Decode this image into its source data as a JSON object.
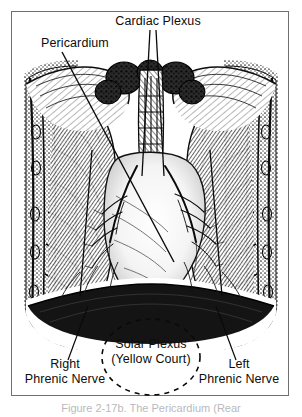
{
  "figure": {
    "caption": "Figure 2-17b. The Pericardium (Rear",
    "border_color": "#6f6f74",
    "ink_color": "#111111",
    "background": "#ffffff"
  },
  "labels": {
    "cardiac_plexus": "Cardiac Plexus",
    "pericardium": "Pericardium",
    "solar_plexus_line1": "Solar Plexus",
    "solar_plexus_line2": "(Yellow Court)",
    "right_phrenic_line1": "Right",
    "right_phrenic_line2": "Phrenic Nerve",
    "left_phrenic_line1": "Left",
    "left_phrenic_line2": "Phrenic Nerve"
  },
  "annotations": {
    "solar_plexus_shape": "dashed-ellipse",
    "leader_count": 6
  }
}
